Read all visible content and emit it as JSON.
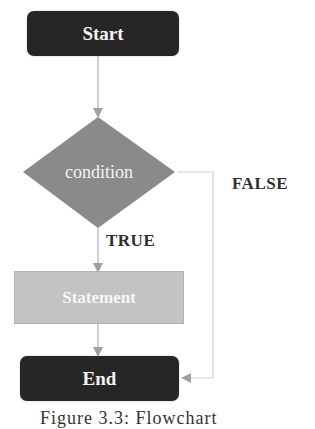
{
  "diagram": {
    "type": "flowchart",
    "nodes": {
      "start": {
        "label": "Start",
        "shape": "rounded-rectangle",
        "fill": "#262626"
      },
      "condition": {
        "label": "condition",
        "shape": "diamond",
        "fill": "#8c8c8c"
      },
      "statement": {
        "label": "Statement",
        "shape": "rectangle",
        "fill": "#c3c3c3"
      },
      "end": {
        "label": "End",
        "shape": "rounded-rectangle",
        "fill": "#262626"
      }
    },
    "edges": [
      {
        "from": "start",
        "to": "condition",
        "label": ""
      },
      {
        "from": "condition",
        "to": "statement",
        "label": "TRUE"
      },
      {
        "from": "statement",
        "to": "end",
        "label": ""
      },
      {
        "from": "condition",
        "to": "end",
        "label": "FALSE"
      }
    ],
    "labels": {
      "true": "TRUE",
      "false": "FALSE"
    },
    "colors": {
      "connector": "#a8a8a8",
      "false_connector": "#cfcfcf",
      "label_text": "#2f2f2f"
    },
    "caption": "Figure 3.3: Flowchart"
  }
}
